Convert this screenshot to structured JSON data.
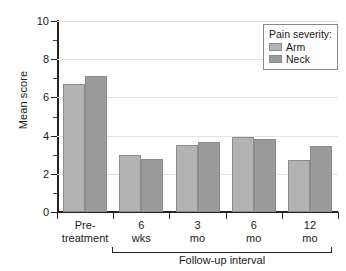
{
  "chart_data": {
    "type": "bar",
    "title": "",
    "xlabel": "Follow-up interval",
    "ylabel": "Mean score",
    "ylim": [
      0,
      10
    ],
    "yticks": [
      0,
      2,
      4,
      6,
      8,
      10
    ],
    "ytick_labels": [
      "0",
      "2",
      "4",
      "6",
      "8",
      "10"
    ],
    "grid": true,
    "legend_position": "top-right",
    "legend_title": "Pain severity:",
    "categories": [
      "Pre-treatment",
      "6 wks",
      "3 mo",
      "6 mo",
      "12 mo"
    ],
    "category_lines": [
      {
        "line1": "Pre-",
        "line2": "treatment"
      },
      {
        "line1": "6",
        "line2": "wks"
      },
      {
        "line1": "3",
        "line2": "mo"
      },
      {
        "line1": "6",
        "line2": "mo"
      },
      {
        "line1": "12",
        "line2": "mo"
      }
    ],
    "series": [
      {
        "name": "Arm",
        "color": "#b3b3b3",
        "values": [
          6.7,
          3.0,
          3.5,
          3.95,
          2.7
        ]
      },
      {
        "name": "Neck",
        "color": "#9a9a9a",
        "values": [
          7.1,
          2.75,
          3.65,
          3.8,
          3.45
        ]
      }
    ],
    "bracket_label": "Follow-up interval",
    "bracket_covers": [
      "6 wks",
      "3 mo",
      "6 mo",
      "12 mo"
    ]
  },
  "axes": {
    "y_title": "Mean score"
  },
  "legend": {
    "title": "Pain severity:",
    "items": [
      {
        "label": "Arm"
      },
      {
        "label": "Neck"
      }
    ]
  },
  "footer": {
    "bracket_label": "Follow-up interval"
  }
}
